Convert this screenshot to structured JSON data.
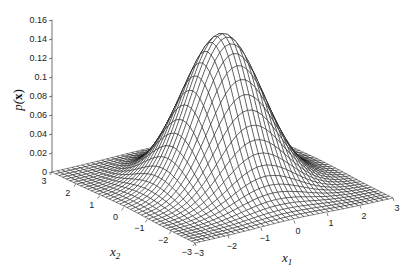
{
  "chart_data": {
    "type": "surface",
    "title": "",
    "function": "p(x) = (1/(2*pi)) * exp(-(x1^2 + x2^2)/2)",
    "peak_value": 0.159,
    "xlabel": "x1",
    "ylabel": "x2",
    "zlabel": "p(x)",
    "x_ticks": [
      -3,
      -2,
      -1,
      0,
      1,
      2,
      3
    ],
    "y_ticks": [
      -3,
      -2,
      -1,
      0,
      1,
      2,
      3
    ],
    "z_ticks": [
      0,
      0.02,
      0.04,
      0.06,
      0.08,
      0.1,
      0.12,
      0.14,
      0.16
    ],
    "z_tick_labels": [
      "0",
      "0.02",
      "0.04",
      "0.06",
      "0.08",
      "0.1",
      "0.12",
      "0.14",
      "0.16"
    ],
    "xlim": [
      -3,
      3
    ],
    "ylim": [
      -3,
      3
    ],
    "zlim": [
      0,
      0.16
    ],
    "grid": false,
    "mesh_resolution": 41,
    "mesh_color": "#000000",
    "face_color": "#ffffff"
  },
  "labels": {
    "z_axis": "p(",
    "z_axis_bold": "x",
    "z_axis_close": ")",
    "x_axis": "x",
    "x_axis_sub": "1",
    "y_axis": "x",
    "y_axis_sub": "2"
  }
}
